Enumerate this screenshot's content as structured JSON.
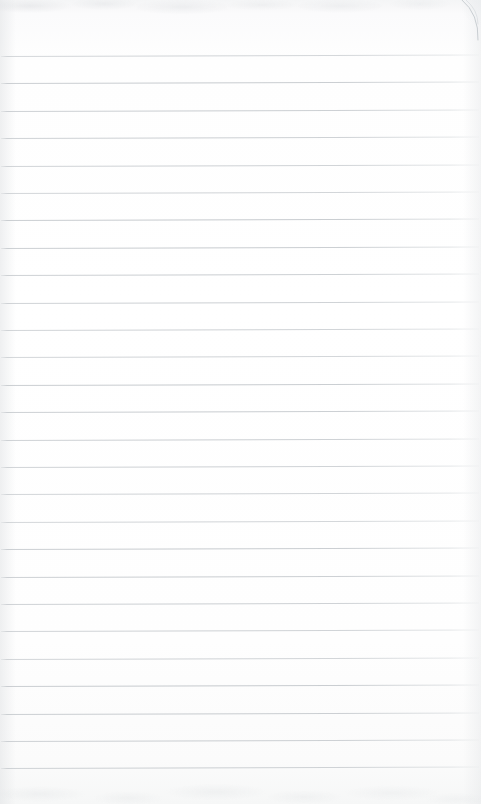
{
  "document": {
    "kind": "lined-notepad-paper",
    "title": "Blank Ruled Paper",
    "content_text": "",
    "has_handwriting": false,
    "page_width": 481,
    "page_height": 804
  },
  "paper": {
    "background_color": "#fdfdfd",
    "background_color_edge": "#f5f6f7",
    "rule_color": "#c6cace",
    "rule_count": 27,
    "rule_spacing": 27.4,
    "first_rule_y": 56,
    "last_rule_y": 774,
    "rule_left_x": 1,
    "rule_right_x": 479,
    "rule_thickness": 1,
    "rule_slant_px": -1.5,
    "top_margin_label": "top margin",
    "top_margin_height": 56,
    "bottom_margin_height": 30
  },
  "rules": [
    {
      "y": 56.0
    },
    {
      "y": 83.4
    },
    {
      "y": 110.8
    },
    {
      "y": 138.2
    },
    {
      "y": 165.6
    },
    {
      "y": 193.0
    },
    {
      "y": 220.4
    },
    {
      "y": 247.8
    },
    {
      "y": 275.2
    },
    {
      "y": 302.6
    },
    {
      "y": 330.0
    },
    {
      "y": 357.4
    },
    {
      "y": 384.8
    },
    {
      "y": 412.2
    },
    {
      "y": 439.6
    },
    {
      "y": 467.0
    },
    {
      "y": 494.4
    },
    {
      "y": 521.8
    },
    {
      "y": 549.2
    },
    {
      "y": 576.6
    },
    {
      "y": 604.0
    },
    {
      "y": 631.4
    },
    {
      "y": 658.8
    },
    {
      "y": 686.2
    },
    {
      "y": 713.6
    },
    {
      "y": 741.0
    },
    {
      "y": 768.4
    }
  ],
  "page_curl": {
    "name": "page-curl",
    "color": "#c9ced2",
    "start_x": 462,
    "start_y": 0,
    "end_x": 478,
    "end_y": 40,
    "control_x": 479,
    "control_y": 14
  },
  "texture": {
    "top_band_height": 22,
    "bottom_band_height": 30,
    "tint": "#c8cccf"
  }
}
